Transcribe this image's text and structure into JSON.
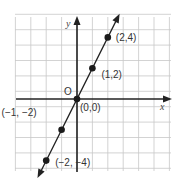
{
  "chart_data": {
    "type": "line",
    "title": "",
    "xlabel": "x",
    "ylabel": "y",
    "origin_label": "O",
    "grid": true,
    "xlim": [
      -4,
      6
    ],
    "ylim": [
      -4.5,
      5.5
    ],
    "series": [
      {
        "name": "y = 2x",
        "x": [
          -2,
          -1,
          0,
          1,
          2
        ],
        "y": [
          -4,
          -2,
          0,
          2,
          4
        ]
      }
    ],
    "points": [
      {
        "x": 2,
        "y": 4,
        "label": "(2,4)"
      },
      {
        "x": 1,
        "y": 2,
        "label": "(1,2)"
      },
      {
        "x": 0,
        "y": 0,
        "label": "(0,0)"
      },
      {
        "x": -1,
        "y": -2,
        "label": "(−1, −2)"
      },
      {
        "x": -2,
        "y": -4,
        "label": "(−2, −4)"
      }
    ],
    "colors": {
      "line": "#222222",
      "grid": "#c8c8c8",
      "axes": "#222222",
      "points": "#1a1a1a"
    }
  }
}
